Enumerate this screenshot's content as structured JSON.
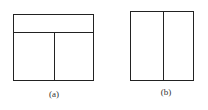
{
  "figures": [
    {
      "label": "(a)",
      "description": "rectangle with top band and two bottom panels"
    },
    {
      "label": "(b)",
      "description": "rectangle split into two vertical panels"
    }
  ]
}
